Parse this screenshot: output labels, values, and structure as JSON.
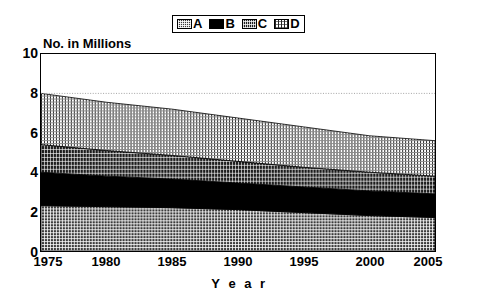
{
  "legend": {
    "position": "top-center",
    "items": [
      {
        "label": "A",
        "pattern": "cross-hatch-dark",
        "swatch_name": "legend-swatch-a"
      },
      {
        "label": "B",
        "pattern": "solid-black",
        "swatch_name": "legend-swatch-b"
      },
      {
        "label": "C",
        "pattern": "fine-dark-grid",
        "swatch_name": "legend-swatch-c"
      },
      {
        "label": "D",
        "pattern": "light-vertical-lines",
        "swatch_name": "legend-swatch-d"
      }
    ]
  },
  "axes": {
    "y_title": "No. in Millions",
    "x_title": "Y e a r",
    "y_ticks": [
      "0",
      "2",
      "4",
      "6",
      "8",
      "10"
    ],
    "x_ticks": [
      "1975",
      "1980",
      "1985",
      "1990",
      "1995",
      "2000",
      "2005"
    ]
  },
  "chart_data": {
    "type": "area",
    "title": "",
    "subtitle": "",
    "xlabel": "Year",
    "ylabel": "No. in Millions",
    "xlim": [
      1975,
      2005
    ],
    "ylim": [
      0,
      10
    ],
    "ytick_step": 2,
    "grid": "horizontal-dotted-at-8",
    "stacked": true,
    "legend_position": "top-center",
    "x": [
      1975,
      1980,
      1985,
      1990,
      1995,
      2000,
      2005
    ],
    "series": [
      {
        "name": "A",
        "values": [
          2.3,
          2.25,
          2.2,
          2.1,
          1.95,
          1.8,
          1.7
        ]
      },
      {
        "name": "B",
        "values": [
          1.7,
          1.55,
          1.45,
          1.35,
          1.3,
          1.25,
          1.2
        ]
      },
      {
        "name": "C",
        "values": [
          1.4,
          1.3,
          1.2,
          1.1,
          1.0,
          0.95,
          0.9
        ]
      },
      {
        "name": "D",
        "values": [
          2.6,
          2.45,
          2.35,
          2.2,
          2.05,
          1.85,
          1.8
        ]
      }
    ],
    "cumulative_tops": {
      "A": [
        2.3,
        2.25,
        2.2,
        2.1,
        1.95,
        1.8,
        1.7
      ],
      "B": [
        4.0,
        3.8,
        3.65,
        3.45,
        3.25,
        3.05,
        2.9
      ],
      "C": [
        5.4,
        5.1,
        4.85,
        4.55,
        4.25,
        4.0,
        3.8
      ],
      "D": [
        8.0,
        7.55,
        7.2,
        6.75,
        6.3,
        5.85,
        5.6
      ]
    },
    "total": [
      8.0,
      7.55,
      7.2,
      6.75,
      6.3,
      5.85,
      5.6
    ],
    "gridlines": [
      8
    ]
  },
  "colors": {
    "axis": "#000000",
    "plot_background": "#ffffff",
    "series_a": "#3b3b3b",
    "series_b": "#000000",
    "series_c": "#1d1d1d",
    "series_d": "#ffffff",
    "gridline": "#999999"
  }
}
